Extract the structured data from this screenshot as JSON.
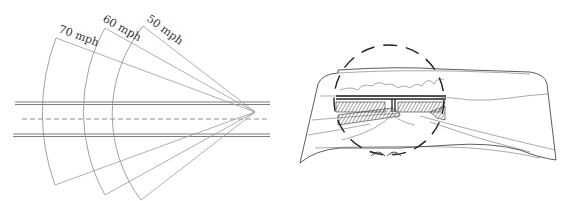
{
  "figure": {
    "left_panel": {
      "title": "Field of vision narrowing with speed",
      "speed_labels": [
        "70 mph",
        "60 mph",
        "50 mph"
      ],
      "cones": [
        {
          "speed": "70 mph",
          "top": [
            56,
            38
          ],
          "bottom": [
            55,
            185
          ]
        },
        {
          "speed": "60 mph",
          "top": [
            105,
            28
          ],
          "bottom": [
            105,
            195
          ]
        },
        {
          "speed": "50 mph",
          "top": [
            143,
            26
          ],
          "bottom": [
            141,
            200
          ]
        }
      ],
      "vertex": [
        255,
        112
      ]
    },
    "right_panel": {
      "description": "Windshield view with dashed circle highlighting focal region (bridge over road)"
    }
  },
  "colors": {
    "line": "#8a8a8a",
    "ink": "#333333",
    "background": "#ffffff"
  }
}
